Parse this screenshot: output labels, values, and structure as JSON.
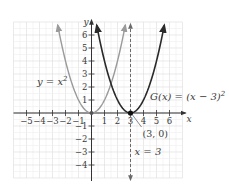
{
  "chart_data": {
    "type": "line",
    "title": "",
    "xlabel": "x",
    "ylabel": "y",
    "xlim": [
      -6,
      7
    ],
    "ylim": [
      -5,
      7
    ],
    "grid": true,
    "x_ticks": [
      -5,
      -4,
      -3,
      -2,
      -1,
      1,
      2,
      3,
      4,
      5,
      6
    ],
    "x_tick_labels": [
      "−5",
      "−4",
      "−3",
      "−2",
      "−1",
      "1",
      "2",
      "3",
      "4",
      "5",
      "6"
    ],
    "y_ticks": [
      -4,
      -3,
      -2,
      -1,
      1,
      2,
      3,
      4,
      5,
      6
    ],
    "y_tick_labels": [
      "−4",
      "−3",
      "−2",
      "−1",
      "1",
      "2",
      "3",
      "4",
      "5",
      "6"
    ],
    "series": [
      {
        "name": "y = x²",
        "label_base": "y = x",
        "label_exp": "2",
        "expression": "x^2",
        "color": "#9a9a9a",
        "x": [
          -2.6,
          -2,
          -1,
          0,
          1,
          2,
          2.6
        ],
        "y": [
          6.76,
          4,
          1,
          0,
          1,
          4,
          6.76
        ]
      },
      {
        "name": "G(x) = (x − 3)²",
        "label_base": "G(x) = (x − 3)",
        "label_exp": "2",
        "expression": "(x-3)^2",
        "color": "#2a2a2a",
        "x": [
          0.4,
          1,
          2,
          3,
          4,
          5,
          5.6
        ],
        "y": [
          6.76,
          4,
          1,
          0,
          1,
          4,
          6.76
        ]
      }
    ],
    "vertical_line": {
      "x": 3,
      "label": "x = 3",
      "style": "dashed",
      "color": "#6a6a6a"
    },
    "annotations": [
      {
        "text": "(3, 0)",
        "x": 3,
        "y": 0,
        "type": "point"
      }
    ],
    "legend": "inline labels"
  }
}
